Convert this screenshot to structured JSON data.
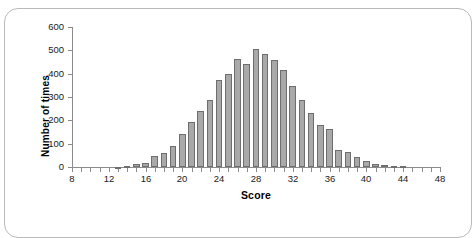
{
  "chart_data": {
    "type": "bar",
    "title": "",
    "xlabel": "Score",
    "ylabel": "Number of times",
    "xlim": [
      8,
      48
    ],
    "ylim": [
      0,
      600
    ],
    "grid": false,
    "legend": null,
    "x_tick_labels": [
      "8",
      "12",
      "16",
      "20",
      "24",
      "28",
      "32",
      "36",
      "40",
      "44",
      "48"
    ],
    "x_tick_values": [
      8,
      12,
      16,
      20,
      24,
      28,
      32,
      36,
      40,
      44,
      48
    ],
    "x_minor_tick_step": 1,
    "y_tick_labels": [
      "0",
      "100",
      "200",
      "300",
      "400",
      "500",
      "600"
    ],
    "y_tick_values": [
      0,
      100,
      200,
      300,
      400,
      500,
      600
    ],
    "bar_color": "#a9a9a9",
    "bar_edge_color": "#6e6e6e",
    "categories": [
      8,
      9,
      10,
      11,
      12,
      13,
      14,
      15,
      16,
      17,
      18,
      19,
      20,
      21,
      22,
      23,
      24,
      25,
      26,
      27,
      28,
      29,
      30,
      31,
      32,
      33,
      34,
      35,
      36,
      37,
      38,
      39,
      40,
      41,
      42,
      43,
      44,
      45,
      46,
      47,
      48
    ],
    "values": [
      0,
      0,
      0,
      0,
      0,
      2,
      4,
      12,
      18,
      47,
      58,
      88,
      143,
      192,
      239,
      288,
      374,
      397,
      462,
      441,
      505,
      484,
      458,
      415,
      347,
      289,
      230,
      178,
      165,
      74,
      66,
      45,
      27,
      14,
      10,
      6,
      6,
      0,
      0,
      0,
      0
    ]
  },
  "axis": {
    "ylabel": "Number of times",
    "xlabel": "Score"
  }
}
